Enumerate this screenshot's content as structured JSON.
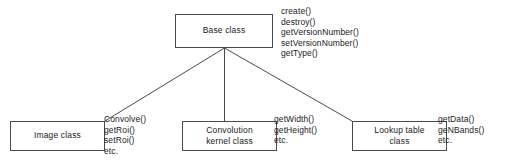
{
  "diagram": {
    "type": "class-hierarchy",
    "style": {
      "background": "#ffffff",
      "box_border": "#4a4a4a",
      "edge_color": "#4a4a4a",
      "text_color": "#1a1a1a"
    },
    "base_class": {
      "name": "Base class",
      "methods": [
        "create()",
        "destroy()",
        "getVersionNumber()",
        "setVersionNumber()",
        "getType()"
      ]
    },
    "subclasses": [
      {
        "name": "Image class",
        "methods": [
          "Convolve()",
          "getRoi()",
          "setRoi()",
          "etc."
        ]
      },
      {
        "name": "Convolution\nkernel class",
        "methods": [
          "getWidth()",
          "getHeight()",
          "etc."
        ]
      },
      {
        "name": "Lookup table\nclass",
        "methods": [
          "getData()",
          "geNBands()",
          "etc."
        ]
      }
    ],
    "edges": [
      {
        "from": "Base class",
        "to": "Image class"
      },
      {
        "from": "Base class",
        "to": "Convolution kernel class"
      },
      {
        "from": "Base class",
        "to": "Lookup table class"
      }
    ]
  }
}
